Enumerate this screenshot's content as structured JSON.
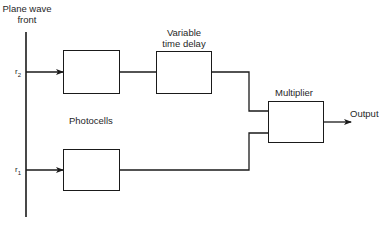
{
  "diagram": {
    "wavefront_label": [
      "Plane wave",
      "front"
    ],
    "delay_label": [
      "Variable",
      "time delay"
    ],
    "multiplier_label": "Multiplier",
    "photocells_label": "Photocells",
    "output_label": "Output",
    "r2_label": "r",
    "r2_sub": "2",
    "r1_label": "r",
    "r1_sub": "1",
    "nodes": [
      {
        "id": "photocell-2",
        "label": ""
      },
      {
        "id": "variable-time-delay",
        "label": "Variable time delay"
      },
      {
        "id": "multiplier",
        "label": "Multiplier"
      },
      {
        "id": "photocell-1",
        "label": ""
      }
    ],
    "edges": [
      {
        "from": "wavefront-r2",
        "to": "photocell-2",
        "arrow": true
      },
      {
        "from": "photocell-2",
        "to": "variable-time-delay",
        "arrow": false
      },
      {
        "from": "variable-time-delay",
        "to": "multiplier",
        "arrow": false
      },
      {
        "from": "wavefront-r1",
        "to": "photocell-1",
        "arrow": true
      },
      {
        "from": "photocell-1",
        "to": "multiplier",
        "arrow": false
      },
      {
        "from": "multiplier",
        "to": "output",
        "arrow": true
      }
    ],
    "line_color": "#1a1a1a"
  }
}
